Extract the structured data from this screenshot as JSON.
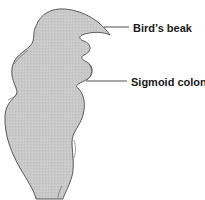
{
  "diagram": {
    "colors": {
      "fill": "#c8c8c8",
      "outline": "#4a4a4a",
      "leader": "#3a3a3a",
      "label": "#1a1a1a",
      "background": "#ffffff"
    },
    "labels": [
      {
        "id": "birds-beak",
        "text": "Bird’s beak"
      },
      {
        "id": "sigmoid-colon",
        "text": "Sigmoid colon"
      }
    ]
  }
}
